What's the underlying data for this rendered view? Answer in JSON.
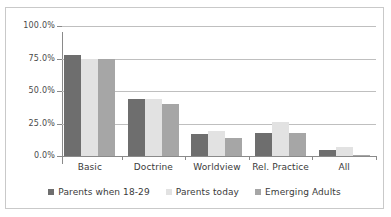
{
  "chart_data": {
    "type": "bar",
    "title": "",
    "subtitle": "",
    "xlabel": "",
    "ylabel": "",
    "categories": [
      "Basic",
      "Doctrine",
      "Worldview",
      "Rel. Practice",
      "All"
    ],
    "series": [
      {
        "name": "Parents when 18-29",
        "color": "#6e6e6e",
        "values": [
          78,
          44,
          17,
          18,
          5
        ]
      },
      {
        "name": "Parents today",
        "color": "#e2e2e2",
        "values": [
          75,
          44,
          19,
          26,
          7
        ]
      },
      {
        "name": "Emerging Adults",
        "color": "#a6a6a6",
        "values": [
          75,
          40,
          14,
          18,
          1
        ]
      }
    ],
    "ylim": [
      0,
      100
    ],
    "ytick_values": [
      0,
      25,
      50,
      75,
      100
    ],
    "ytick_labels": [
      "0.0%",
      "25.0%",
      "50.0%",
      "75.0%",
      "100.0%"
    ],
    "grid": "horizontal",
    "legend_position": "bottom",
    "annotations": []
  },
  "frame": {
    "border_color": "#c9c9c9",
    "background": "#ffffff"
  }
}
